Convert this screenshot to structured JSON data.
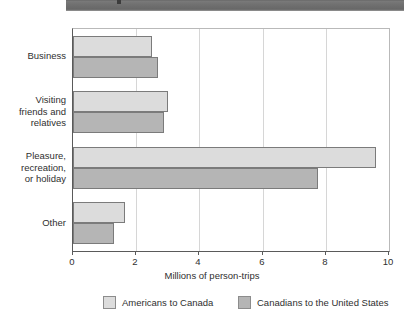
{
  "titlebar": {
    "present": true,
    "color": "#6e6e6e"
  },
  "chart_data": {
    "type": "bar",
    "orientation": "horizontal",
    "title": "",
    "xlabel": "Millions of person-trips",
    "ylabel": "",
    "xlim": [
      0,
      10
    ],
    "xticks": [
      0,
      2,
      4,
      6,
      8,
      10
    ],
    "xticklabels": [
      "0",
      "2",
      "4",
      "6",
      "8",
      "10"
    ],
    "grid": "vertical",
    "legend_position": "bottom",
    "categories": [
      "Business",
      "Visiting friends and relatives",
      "Pleasure, recreation, or holiday",
      "Other"
    ],
    "category_label_lines": [
      [
        "Business"
      ],
      [
        "Visiting",
        "friends and",
        "relatives"
      ],
      [
        "Pleasure,",
        "recreation,",
        "or holiday"
      ],
      [
        "Other"
      ]
    ],
    "series": [
      {
        "name": "Americans to Canada",
        "color": "#dcdcdc",
        "values": [
          2.5,
          3.0,
          9.6,
          1.65
        ]
      },
      {
        "name": "Canadians to the United States",
        "color": "#b5b5b5",
        "values": [
          2.7,
          2.88,
          7.75,
          1.3
        ]
      }
    ]
  },
  "axis": {
    "tick_0": "0",
    "tick_1": "2",
    "tick_2": "4",
    "tick_3": "6",
    "tick_4": "8",
    "tick_5": "10",
    "xlabel": "Millions of person-trips"
  },
  "legend": {
    "items": [
      {
        "label": "Americans to Canada"
      },
      {
        "label": "Canadians to the United States"
      }
    ]
  },
  "categories": {
    "c0_l0": "Business",
    "c1_l0": "Visiting",
    "c1_l1": "friends and",
    "c1_l2": "relatives",
    "c2_l0": "Pleasure,",
    "c2_l1": "recreation,",
    "c2_l2": "or holiday",
    "c3_l0": "Other"
  }
}
